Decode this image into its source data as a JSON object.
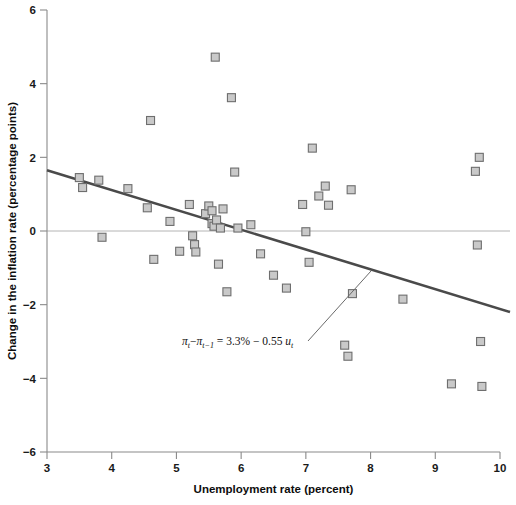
{
  "chart_data": {
    "type": "scatter",
    "title": "",
    "xlabel": "Unemployment rate (percent)",
    "ylabel": "Change in the inflation rate (percentage points)",
    "xlim": [
      3,
      10
    ],
    "ylim": [
      -6,
      6
    ],
    "xticks": [
      3,
      4,
      5,
      6,
      7,
      8,
      9,
      10
    ],
    "xtick_labels": [
      "3",
      "4",
      "5",
      "6",
      "7",
      "8",
      "9",
      "10"
    ],
    "yticks": [
      -6,
      -4,
      -2,
      0,
      2,
      4,
      6
    ],
    "ytick_labels": [
      "−6",
      "−4",
      "−2",
      "0",
      "2",
      "4",
      "6"
    ],
    "grid": false,
    "legend": false,
    "zero_line": true,
    "marker_face_color": "#c9c9c9",
    "marker_edge_color": "#6e6e6e",
    "fit_line_color": "#4a4a4a",
    "axis_color": "#8a8a8a",
    "points": [
      {
        "x": 3.5,
        "y": 1.45
      },
      {
        "x": 3.55,
        "y": 1.18
      },
      {
        "x": 3.8,
        "y": 1.38
      },
      {
        "x": 3.85,
        "y": -0.17
      },
      {
        "x": 4.25,
        "y": 1.15
      },
      {
        "x": 4.55,
        "y": 0.63
      },
      {
        "x": 4.6,
        "y": 3.0
      },
      {
        "x": 4.65,
        "y": -0.77
      },
      {
        "x": 4.9,
        "y": 0.26
      },
      {
        "x": 5.05,
        "y": -0.55
      },
      {
        "x": 5.2,
        "y": 0.72
      },
      {
        "x": 5.25,
        "y": -0.13
      },
      {
        "x": 5.28,
        "y": -0.37
      },
      {
        "x": 5.3,
        "y": -0.57
      },
      {
        "x": 5.45,
        "y": 0.47
      },
      {
        "x": 5.5,
        "y": 0.68
      },
      {
        "x": 5.55,
        "y": 0.55
      },
      {
        "x": 5.55,
        "y": 0.2
      },
      {
        "x": 5.58,
        "y": 0.13
      },
      {
        "x": 5.6,
        "y": 4.72
      },
      {
        "x": 5.62,
        "y": 0.3
      },
      {
        "x": 5.65,
        "y": -0.9
      },
      {
        "x": 5.68,
        "y": 0.08
      },
      {
        "x": 5.72,
        "y": 0.6
      },
      {
        "x": 5.78,
        "y": -1.65
      },
      {
        "x": 5.85,
        "y": 3.62
      },
      {
        "x": 5.9,
        "y": 1.6
      },
      {
        "x": 5.95,
        "y": 0.08
      },
      {
        "x": 6.15,
        "y": 0.17
      },
      {
        "x": 6.3,
        "y": -0.62
      },
      {
        "x": 6.5,
        "y": -1.2
      },
      {
        "x": 6.7,
        "y": -1.55
      },
      {
        "x": 6.95,
        "y": 0.72
      },
      {
        "x": 7.0,
        "y": -0.02
      },
      {
        "x": 7.05,
        "y": -0.85
      },
      {
        "x": 7.1,
        "y": 2.25
      },
      {
        "x": 7.2,
        "y": 0.95
      },
      {
        "x": 7.3,
        "y": 1.22
      },
      {
        "x": 7.35,
        "y": 0.7
      },
      {
        "x": 7.6,
        "y": -3.1
      },
      {
        "x": 7.65,
        "y": -3.4
      },
      {
        "x": 7.7,
        "y": 1.12
      },
      {
        "x": 7.72,
        "y": -1.7
      },
      {
        "x": 8.5,
        "y": -1.85
      },
      {
        "x": 9.25,
        "y": -4.15
      },
      {
        "x": 9.62,
        "y": 1.62
      },
      {
        "x": 9.65,
        "y": -0.38
      },
      {
        "x": 9.68,
        "y": 2.0
      },
      {
        "x": 9.7,
        "y": -3.0
      },
      {
        "x": 9.72,
        "y": -4.22
      }
    ],
    "fit_line": {
      "intercept": 3.3,
      "slope": -0.55,
      "x_start": 3.0,
      "x_end": 10.0,
      "y_start": 1.65,
      "y_end": -2.2
    },
    "annotation": {
      "equation_parts": {
        "pi1": "π",
        "sub1": "t",
        "minus1": "−",
        "pi2": "π",
        "sub2": "t−1",
        "equals": "=",
        "intercept": "3.3%",
        "minus2": "−",
        "slope": "0.55",
        "u": "u",
        "sub3": "t"
      },
      "equation_plain": "πt − πt−1 = 3.3% − 0.55 ut",
      "text_x": 182,
      "text_y": 345,
      "leader_from": [
        308,
        341
      ],
      "leader_to": [
        371,
        271
      ]
    }
  }
}
